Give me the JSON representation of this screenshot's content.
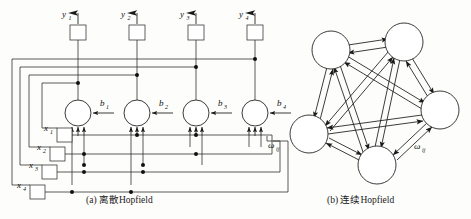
{
  "figure": {
    "background_color": "#fdfdfb",
    "line_color": "#262626"
  },
  "panels": [
    {
      "id": "a",
      "caption": "(a) 离散Hopfield",
      "caption_prefix": "(a)",
      "caption_text": "离散Hopfield",
      "type": "discrete-hopfield-block-diagram",
      "outputs": [
        {
          "label": "y",
          "sub": "1"
        },
        {
          "label": "y",
          "sub": "2"
        },
        {
          "label": "y",
          "sub": "3"
        },
        {
          "label": "y",
          "sub": "4"
        }
      ],
      "inputs": [
        {
          "label": "x",
          "sub": "1"
        },
        {
          "label": "x",
          "sub": "2"
        },
        {
          "label": "x",
          "sub": "3"
        },
        {
          "label": "x",
          "sub": "4"
        }
      ],
      "biases": [
        {
          "label": "b",
          "sub": "1"
        },
        {
          "label": "b",
          "sub": "2"
        },
        {
          "label": "b",
          "sub": "3"
        },
        {
          "label": "b",
          "sub": "4"
        }
      ],
      "weight_label": {
        "label": "ω",
        "sub": "ij"
      },
      "neuron_count": 4,
      "delay_block_count": 4
    },
    {
      "id": "b",
      "caption": "(b) 连续Hopfield",
      "caption_prefix": "(b)",
      "caption_text": "连续Hopfield",
      "type": "continuous-hopfield-graph",
      "node_count": 5,
      "weight_label": {
        "label": "ω",
        "sub": "ij"
      },
      "fully_connected": true,
      "bidirectional": true
    }
  ]
}
